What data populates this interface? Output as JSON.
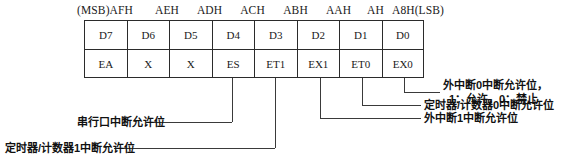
{
  "figure": {
    "addresses": [
      "(MSB)AFH",
      "AEH",
      "ADH",
      "ACH",
      "ABH",
      "AAH",
      "AH",
      "A8H(LSB)"
    ],
    "bit_numbers": [
      "D7",
      "D6",
      "D5",
      "D4",
      "D3",
      "D2",
      "D1",
      "D0"
    ],
    "bit_names": [
      "EA",
      "X",
      "X",
      "ES",
      "ET1",
      "EX1",
      "ET0",
      "EX0"
    ],
    "annotations": {
      "ex0_line1": "外中断0中断允许位，",
      "ex0_line2": "1：允许，0：禁止",
      "et0": "定时器/计数器0中断允许位",
      "ex1": "外中断1中断允许位",
      "es": "串行口中断允许位",
      "et1": "定时器/计数器1中断允许位"
    }
  },
  "colors": {
    "ink": "#1a1a1a",
    "rule": "#2b2b2b",
    "leader": "#3a3a3a",
    "page": "#ffffff"
  }
}
